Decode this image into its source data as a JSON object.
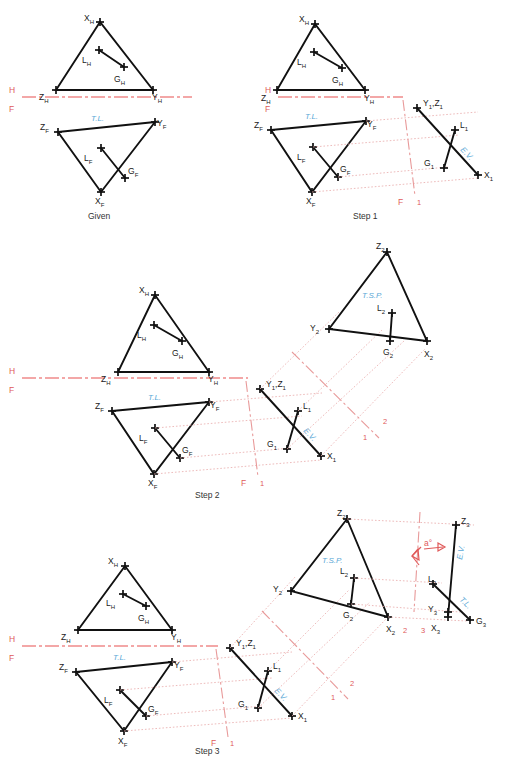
{
  "document": {
    "title": "Descriptive Geometry - True Size of Plane and Angle Between Line and Plane",
    "background_color": "#ffffff",
    "line_color": "#111111",
    "projection_color": "#e8a9a9",
    "reference_line_color": "#ef8a8a",
    "annotation_blue": "#5aa8d6",
    "annotation_red": "#e05a5a"
  },
  "panels": [
    {
      "id": "given",
      "caption": "Given",
      "reference_labels": {
        "top": "H",
        "bottom": "F"
      },
      "points": [
        {
          "name": "X_H",
          "base": "X",
          "sub": "H"
        },
        {
          "name": "L_H",
          "base": "L",
          "sub": "H"
        },
        {
          "name": "G_H",
          "base": "G",
          "sub": "H"
        },
        {
          "name": "Z_H",
          "base": "Z",
          "sub": "H"
        },
        {
          "name": "Y_H",
          "base": "Y",
          "sub": "H"
        },
        {
          "name": "Z_F",
          "base": "Z",
          "sub": "F"
        },
        {
          "name": "Y_F",
          "base": "Y",
          "sub": "F"
        },
        {
          "name": "L_F",
          "base": "L",
          "sub": "F"
        },
        {
          "name": "G_F",
          "base": "G",
          "sub": "F"
        },
        {
          "name": "X_F",
          "base": "X",
          "sub": "F"
        }
      ],
      "annotations": [
        {
          "text": "T.L.",
          "color": "#5aa8d6"
        }
      ]
    },
    {
      "id": "step1",
      "caption": "Step 1",
      "reference_labels": {
        "top": "H",
        "bottom": "F",
        "aux_left": "F",
        "aux_right": "1"
      },
      "points": [
        {
          "name": "X_H",
          "base": "X",
          "sub": "H"
        },
        {
          "name": "L_H",
          "base": "L",
          "sub": "H"
        },
        {
          "name": "G_H",
          "base": "G",
          "sub": "H"
        },
        {
          "name": "Z_H",
          "base": "Z",
          "sub": "H"
        },
        {
          "name": "Y_H",
          "base": "Y",
          "sub": "H"
        },
        {
          "name": "Z_F",
          "base": "Z",
          "sub": "F"
        },
        {
          "name": "Y_F",
          "base": "Y",
          "sub": "F"
        },
        {
          "name": "L_F",
          "base": "L",
          "sub": "F"
        },
        {
          "name": "G_F",
          "base": "G",
          "sub": "F"
        },
        {
          "name": "X_F",
          "base": "X",
          "sub": "F"
        },
        {
          "name": "Y1Z1",
          "base": "Y",
          "sub": "1",
          "base2": "Z",
          "sub2": "1"
        },
        {
          "name": "L_1",
          "base": "L",
          "sub": "1"
        },
        {
          "name": "G_1",
          "base": "G",
          "sub": "1"
        },
        {
          "name": "X_1",
          "base": "X",
          "sub": "1"
        }
      ],
      "annotations": [
        {
          "text": "T.L.",
          "color": "#5aa8d6"
        },
        {
          "text": "E.V.",
          "color": "#5aa8d6"
        }
      ]
    },
    {
      "id": "step2",
      "caption": "Step 2",
      "reference_labels": {
        "top": "H",
        "bottom": "F",
        "aux_left": "F",
        "aux_right": "1",
        "aux2_left": "1",
        "aux2_right": "2"
      },
      "points": [
        {
          "name": "X_H",
          "base": "X",
          "sub": "H"
        },
        {
          "name": "L_H",
          "base": "L",
          "sub": "H"
        },
        {
          "name": "G_H",
          "base": "G",
          "sub": "H"
        },
        {
          "name": "Z_H",
          "base": "Z",
          "sub": "H"
        },
        {
          "name": "Y_H",
          "base": "Y",
          "sub": "H"
        },
        {
          "name": "Z_F",
          "base": "Z",
          "sub": "F"
        },
        {
          "name": "Y_F",
          "base": "Y",
          "sub": "F"
        },
        {
          "name": "L_F",
          "base": "L",
          "sub": "F"
        },
        {
          "name": "G_F",
          "base": "G",
          "sub": "F"
        },
        {
          "name": "X_F",
          "base": "X",
          "sub": "F"
        },
        {
          "name": "Y1Z1",
          "base": "Y",
          "sub": "1",
          "base2": "Z",
          "sub2": "1"
        },
        {
          "name": "L_1",
          "base": "L",
          "sub": "1"
        },
        {
          "name": "G_1",
          "base": "G",
          "sub": "1"
        },
        {
          "name": "X_1",
          "base": "X",
          "sub": "1"
        },
        {
          "name": "Z_2",
          "base": "Z",
          "sub": "2"
        },
        {
          "name": "Y_2",
          "base": "Y",
          "sub": "2"
        },
        {
          "name": "L_2",
          "base": "L",
          "sub": "2"
        },
        {
          "name": "G_2",
          "base": "G",
          "sub": "2"
        },
        {
          "name": "X_2",
          "base": "X",
          "sub": "2"
        }
      ],
      "annotations": [
        {
          "text": "T.L.",
          "color": "#5aa8d6"
        },
        {
          "text": "E.V.",
          "color": "#5aa8d6"
        },
        {
          "text": "T.S.P.",
          "color": "#5aa8d6"
        }
      ]
    },
    {
      "id": "step3",
      "caption": "Step 3",
      "reference_labels": {
        "top": "H",
        "bottom": "F",
        "aux_left": "F",
        "aux_right": "1",
        "aux2_left": "1",
        "aux2_right": "2",
        "aux3_left": "2",
        "aux3_right": "3"
      },
      "points": [
        {
          "name": "X_H",
          "base": "X",
          "sub": "H"
        },
        {
          "name": "L_H",
          "base": "L",
          "sub": "H"
        },
        {
          "name": "G_H",
          "base": "G",
          "sub": "H"
        },
        {
          "name": "Z_H",
          "base": "Z",
          "sub": "H"
        },
        {
          "name": "Y_H",
          "base": "Y",
          "sub": "H"
        },
        {
          "name": "Z_F",
          "base": "Z",
          "sub": "F"
        },
        {
          "name": "Y_F",
          "base": "Y",
          "sub": "F"
        },
        {
          "name": "L_F",
          "base": "L",
          "sub": "F"
        },
        {
          "name": "G_F",
          "base": "G",
          "sub": "F"
        },
        {
          "name": "X_F",
          "base": "X",
          "sub": "F"
        },
        {
          "name": "Y1Z1",
          "base": "Y",
          "sub": "1",
          "base2": "Z",
          "sub2": "1"
        },
        {
          "name": "L_1",
          "base": "L",
          "sub": "1"
        },
        {
          "name": "G_1",
          "base": "G",
          "sub": "1"
        },
        {
          "name": "X_1",
          "base": "X",
          "sub": "1"
        },
        {
          "name": "Z_2",
          "base": "Z",
          "sub": "2"
        },
        {
          "name": "Y_2",
          "base": "Y",
          "sub": "2"
        },
        {
          "name": "L_2",
          "base": "L",
          "sub": "2"
        },
        {
          "name": "G_2",
          "base": "G",
          "sub": "2"
        },
        {
          "name": "X_2",
          "base": "X",
          "sub": "2"
        },
        {
          "name": "Z_3",
          "base": "Z",
          "sub": "3"
        },
        {
          "name": "Y_3",
          "base": "Y",
          "sub": "3"
        },
        {
          "name": "X_3",
          "base": "X",
          "sub": "3"
        },
        {
          "name": "G_3",
          "base": "G",
          "sub": "3"
        },
        {
          "name": "L_3",
          "base": "L",
          "sub": "3"
        }
      ],
      "annotations": [
        {
          "text": "T.L.",
          "color": "#5aa8d6"
        },
        {
          "text": "E.V.",
          "color": "#5aa8d6"
        },
        {
          "text": "T.S.P.",
          "color": "#5aa8d6"
        },
        {
          "text": "E.V.",
          "color": "#5aa8d6"
        },
        {
          "text": "T.L.",
          "color": "#5aa8d6"
        },
        {
          "text": "a°",
          "color": "#e05a5a"
        }
      ]
    }
  ],
  "labels": {
    "H": "H",
    "F": "F",
    "one": "1",
    "two": "2",
    "three": "3",
    "TL": "T.L.",
    "EV": "E.V.",
    "TSP": "T.S.P.",
    "angle": "a°",
    "given": "Given",
    "step1": "Step 1",
    "step2": "Step 2",
    "step3": "Step 3",
    "X": "X",
    "Y": "Y",
    "Z": "Z",
    "L": "L",
    "G": "G",
    "subH": "H",
    "subF": "F",
    "sub1": "1",
    "sub2": "2",
    "sub3": "3",
    "comma": ","
  }
}
